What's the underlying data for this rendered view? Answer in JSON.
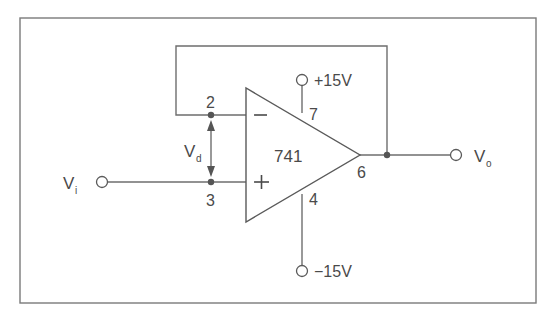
{
  "diagram": {
    "type": "op-amp voltage follower circuit",
    "opamp": {
      "label": "741"
    },
    "inputs": {
      "inverting": {
        "symbol": "−",
        "pin": "2"
      },
      "noninverting": {
        "symbol": "+",
        "pin": "3"
      }
    },
    "output": {
      "pin": "6",
      "label": "V",
      "label_sub": "o"
    },
    "input_terminal": {
      "label": "V",
      "label_sub": "i"
    },
    "differential_voltage": {
      "label": "V",
      "label_sub": "d"
    },
    "supply_positive": {
      "pin": "7",
      "label": "+15V"
    },
    "supply_negative": {
      "pin": "4",
      "label": "−15V"
    },
    "colors": {
      "wire": "#6e6e6e",
      "frame": "#7a7a7a",
      "text": "#4a4a4a",
      "background": "#ffffff"
    }
  }
}
